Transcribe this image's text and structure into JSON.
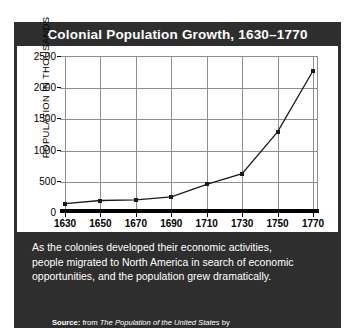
{
  "title": "Colonial Population Growth, 1630–1770",
  "caption": {
    "line1": "As the colonies developed their economic activities,",
    "line2": "people migrated to North America in search of economic",
    "line3": "opportunities, and the population grew dramatically."
  },
  "source": {
    "label": "Source:",
    "prefix": "from",
    "book": "The Population of the United States",
    "by": "by",
    "authors": "Douglas L. Anderton, Richard E. Barrett, and Donald J. Bogue, 1997"
  },
  "colors": {
    "panel": "#2e2e2e",
    "panel_text": "#ffffff",
    "plot_background": "#ffffff",
    "gridline": "#8e8e8e",
    "axis": "#000000",
    "series": "#1a1a1a"
  },
  "chart_data": {
    "type": "line",
    "title": "Colonial Population Growth, 1630–1770",
    "xlabel": "",
    "ylabel": "POPULATION IN THOUSANDS",
    "x": [
      1630,
      1650,
      1670,
      1690,
      1710,
      1730,
      1750,
      1770
    ],
    "categories": [
      "1630",
      "1650",
      "1670",
      "1690",
      "1710",
      "1730",
      "1750",
      "1770"
    ],
    "values": [
      150,
      200,
      210,
      260,
      460,
      630,
      1300,
      2280
    ],
    "series": [
      {
        "name": "Colonial population",
        "values": [
          150,
          200,
          210,
          260,
          460,
          630,
          1300,
          2280
        ]
      }
    ],
    "ylim": [
      0,
      2500
    ],
    "yticks": [
      0,
      500,
      1000,
      1500,
      2000,
      2500
    ],
    "ytick_labels": [
      "0",
      "500",
      "1000",
      "1500",
      "2000",
      "2500"
    ],
    "xlim": [
      1630,
      1770
    ],
    "grid": true,
    "legend": false,
    "markers": "square"
  }
}
